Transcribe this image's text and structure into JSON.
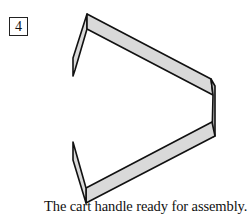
{
  "step": {
    "number": "4"
  },
  "figure": {
    "fill_color": "#d9d9d9",
    "stroke_color": "#111111"
  },
  "caption": {
    "text": "The cart handle ready for assembly."
  }
}
